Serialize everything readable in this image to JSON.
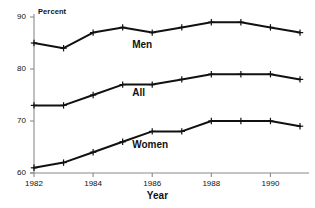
{
  "chart_data": {
    "type": "line",
    "title": "",
    "xlabel": "Year",
    "ylabel": "Percent",
    "ylim": [
      60,
      90
    ],
    "xlim": [
      1982,
      1991
    ],
    "grid": false,
    "legend_position": "inline-annotations",
    "x": [
      1982,
      1983,
      1984,
      1985,
      1986,
      1987,
      1988,
      1989,
      1990,
      1991
    ],
    "xticks": [
      "1982",
      "1984",
      "1986",
      "1988",
      "1990"
    ],
    "xtick_values": [
      1982,
      1984,
      1986,
      1988,
      1990
    ],
    "yticks": [
      "60",
      "70",
      "80",
      "90"
    ],
    "ytick_values": [
      60,
      70,
      80,
      90
    ],
    "series": [
      {
        "name": "Men",
        "values": [
          85,
          84,
          87,
          88,
          87,
          88,
          89,
          89,
          88,
          87
        ],
        "color": "#111111",
        "marker": "plus"
      },
      {
        "name": "All",
        "values": [
          73,
          73,
          75,
          77,
          77,
          78,
          79,
          79,
          79,
          78
        ],
        "color": "#111111",
        "marker": "plus"
      },
      {
        "name": "Women",
        "values": [
          61,
          62,
          64,
          66,
          68,
          68,
          70,
          70,
          70,
          69
        ],
        "color": "#111111",
        "marker": "plus"
      }
    ],
    "annotations": [
      {
        "text": "Men",
        "x": 1986,
        "y": 84.5
      },
      {
        "text": "All",
        "x": 1986,
        "y": 75.2
      },
      {
        "text": "Women",
        "x": 1986,
        "y": 65.2
      }
    ]
  }
}
